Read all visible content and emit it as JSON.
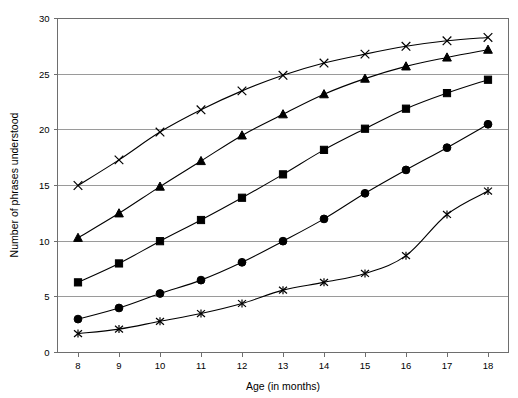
{
  "chart_data": {
    "type": "line",
    "title": "",
    "xlabel": "Age (in months)",
    "ylabel": "Number of phrases understood",
    "x": [
      8,
      9,
      10,
      11,
      12,
      13,
      14,
      15,
      16,
      17,
      18
    ],
    "xlim": [
      7.5,
      18.5
    ],
    "ylim": [
      0,
      30
    ],
    "xticks": [
      8,
      9,
      10,
      11,
      12,
      13,
      14,
      15,
      16,
      17,
      18
    ],
    "yticks": [
      0,
      5,
      10,
      15,
      20,
      25,
      30
    ],
    "grid": "horizontal",
    "legend": "none",
    "series": [
      {
        "name": "series-1-cross",
        "marker": "cross",
        "values": [
          15.0,
          17.3,
          19.8,
          21.8,
          23.5,
          24.9,
          26.0,
          26.8,
          27.5,
          28.0,
          28.3
        ]
      },
      {
        "name": "series-2-triangle",
        "marker": "triangle",
        "values": [
          10.3,
          12.5,
          14.9,
          17.2,
          19.5,
          21.4,
          23.2,
          24.6,
          25.7,
          26.5,
          27.2
        ]
      },
      {
        "name": "series-3-square",
        "marker": "square",
        "values": [
          6.3,
          8.0,
          10.0,
          11.9,
          13.9,
          16.0,
          18.2,
          20.1,
          21.9,
          23.3,
          24.5
        ]
      },
      {
        "name": "series-4-circle",
        "marker": "circle",
        "values": [
          3.0,
          4.0,
          5.3,
          6.5,
          8.1,
          10.0,
          12.0,
          14.3,
          16.4,
          18.4,
          20.5
        ]
      },
      {
        "name": "series-5-asterisk",
        "marker": "asterisk",
        "values": [
          1.7,
          2.1,
          2.8,
          3.5,
          4.4,
          5.6,
          6.3,
          7.1,
          8.7,
          12.4,
          14.5
        ]
      }
    ],
    "colors": {
      "line": "#000000",
      "marker": "#000000",
      "gridline": "#9a9a9a",
      "axis": "#6e6e6e",
      "background": "#ffffff"
    }
  },
  "axes": {
    "y_tick_labels": [
      "0",
      "5",
      "10",
      "15",
      "20",
      "25",
      "30"
    ],
    "x_tick_labels": [
      "8",
      "9",
      "10",
      "11",
      "12",
      "13",
      "14",
      "15",
      "16",
      "17",
      "18"
    ],
    "x_axis_title": "Age (in months)",
    "y_axis_title": "Number of phrases understood"
  }
}
